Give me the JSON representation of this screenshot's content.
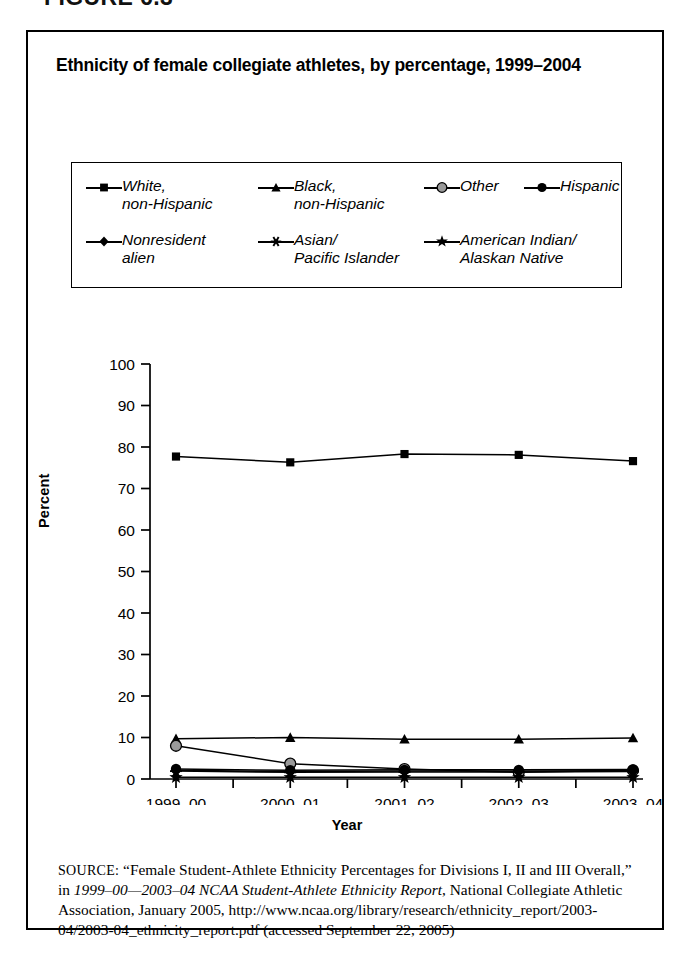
{
  "figure_caption": "FIGURE 6.3",
  "chart_title": "Ethnicity of female collegiate athletes, by percentage, 1999–2004",
  "legend": {
    "rows": [
      [
        {
          "marker": "square",
          "label": "White,\nnon-Hispanic",
          "name": "white-non-hispanic"
        },
        {
          "marker": "triangle",
          "label": "Black,\nnon-Hispanic",
          "name": "black-non-hispanic"
        },
        {
          "marker": "circle-gray",
          "label": "Other",
          "name": "other"
        },
        {
          "marker": "circle-black",
          "label": "Hispanic",
          "name": "hispanic"
        }
      ],
      [
        {
          "marker": "diamond",
          "label": "Nonresident\nalien",
          "name": "nonresident-alien"
        },
        {
          "marker": "asterisk",
          "label": "Asian/\nPacific Islander",
          "name": "asian-pacific-islander"
        },
        {
          "marker": "star",
          "label": "American Indian/\nAlaskan Native",
          "name": "american-indian-alaskan-native"
        }
      ]
    ]
  },
  "chart_data": {
    "type": "line",
    "title": "Ethnicity of female collegiate athletes, by percentage, 1999–2004",
    "xlabel": "Year",
    "ylabel": "Percent",
    "categories": [
      "1999–00",
      "2000–01",
      "2001–02",
      "2002–03",
      "2003–04"
    ],
    "ylim": [
      0,
      100
    ],
    "yticks": [
      0,
      10,
      20,
      30,
      40,
      50,
      60,
      70,
      80,
      90,
      100
    ],
    "grid": false,
    "legend_position": "top",
    "series": [
      {
        "name": "White, non-Hispanic",
        "marker": "square",
        "color": "#000000",
        "values": [
          77.7,
          76.3,
          78.3,
          78.1,
          76.6
        ]
      },
      {
        "name": "Black, non-Hispanic",
        "marker": "triangle",
        "color": "#000000",
        "values": [
          9.7,
          10.0,
          9.6,
          9.6,
          9.9
        ]
      },
      {
        "name": "Other",
        "marker": "circle-gray",
        "color": "#888888",
        "values": [
          8.0,
          3.7,
          2.4,
          1.6,
          2.1
        ]
      },
      {
        "name": "Hispanic",
        "marker": "circle-black",
        "color": "#000000",
        "values": [
          2.4,
          2.1,
          2.2,
          2.2,
          2.3
        ]
      },
      {
        "name": "Nonresident alien",
        "marker": "diamond",
        "color": "#000000",
        "values": [
          2.1,
          1.8,
          1.9,
          1.9,
          2.0
        ]
      },
      {
        "name": "Asian/Pacific Islander",
        "marker": "asterisk",
        "color": "#000000",
        "values": [
          1.9,
          1.6,
          1.7,
          1.7,
          1.8
        ]
      },
      {
        "name": "American Indian/Alaskan Native",
        "marker": "star",
        "color": "#000000",
        "values": [
          0.4,
          0.4,
          0.4,
          0.4,
          0.4
        ]
      }
    ]
  },
  "source": {
    "label": "SOURCE:",
    "text_1": "“Female Student-Athlete Ethnicity Percentages for Divisions I, II and III Overall,” in ",
    "italic_1": "1999–00—2003–04 NCAA Student-Athlete Ethnicity Report",
    "text_2": ", National Collegiate Athletic Association, January 2005, http://www.ncaa.org/library/research/ethnicity_report/2003-04/2003-04_ethnicity_report.pdf (accessed September 22, 2005)"
  }
}
